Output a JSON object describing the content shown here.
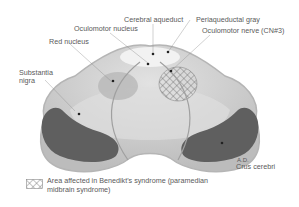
{
  "figure": {
    "labels": {
      "cerebral_aqueduct": "Cerebral aqueduct",
      "periaqueductal_gray": "Periaqueductal gray",
      "oculomotor_nucleus": "Oculomotor nucleus",
      "oculomotor_nerve": "Oculomotor nerve (CN#3)",
      "red_nucleus": "Red nucleus",
      "substantia_nigra_line1": "Substantia",
      "substantia_nigra_line2": "nigra",
      "crus_cerebri": "Crus cerebri",
      "initials": "A.D."
    },
    "colors": {
      "midbrain_fill": "#c8c8c8",
      "midbrain_light": "#e6e6e6",
      "crus_dark": "#5f5f5f",
      "outline": "#b0b0b0",
      "aqueduct": "#f4f4f4",
      "red_nucleus": "#b4b4b4",
      "hatch": "#6a6a6a"
    }
  },
  "legend": {
    "text": "Area affected in Benedikt's syndrome (paramedian midbrain syndrome)"
  }
}
